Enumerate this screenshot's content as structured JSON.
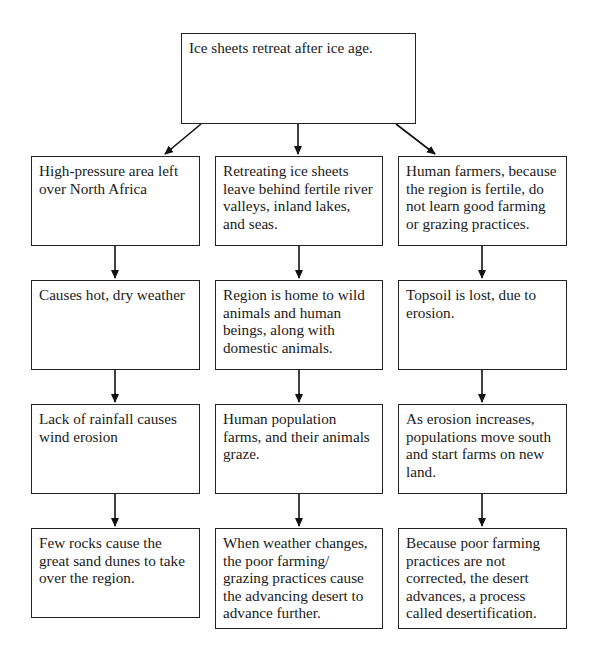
{
  "diagram": {
    "root": {
      "text": "Ice sheets retreat after ice age."
    },
    "columns": [
      {
        "boxes": [
          {
            "text": "High-pressure area left over North Africa"
          },
          {
            "text": "Causes hot, dry weather"
          },
          {
            "text": "Lack of rainfall causes wind erosion"
          },
          {
            "text": "Few rocks cause the great sand dunes to take over the region."
          }
        ]
      },
      {
        "boxes": [
          {
            "text": "Retreating ice sheets leave behind fertile river valleys, inland lakes, and seas."
          },
          {
            "text": "Region is home to wild animals and human beings, along with domestic animals."
          },
          {
            "text": "Human population farms, and their animals graze."
          },
          {
            "text": "When weather changes, the poor farming/ grazing practices cause the advancing desert to advance further."
          }
        ]
      },
      {
        "boxes": [
          {
            "text": "Human farmers, because the region is fertile, do not learn good farming or grazing practices."
          },
          {
            "text": "Topsoil is lost, due to erosion."
          },
          {
            "text": "As erosion increases, populations move south and start farms on new land."
          },
          {
            "text": "Because poor farming practices are not corrected, the desert advances, a process called desertification."
          }
        ]
      }
    ]
  }
}
